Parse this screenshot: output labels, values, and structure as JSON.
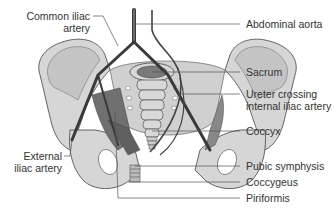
{
  "diagram": {
    "type": "anatomical illustration",
    "colors": {
      "bone_fill": "#d6d6d6",
      "bone_inner": "#c4c4c4",
      "outline": "#555555",
      "vessel": "#3a3a3a",
      "muscle": "#707070",
      "leader": "#555555",
      "text": "#333333"
    },
    "labels_left": [
      {
        "id": "common-iliac-artery",
        "line1": "Common iliac",
        "line2": "artery"
      },
      {
        "id": "external-iliac-artery",
        "line1": "External",
        "line2": "iliac artery"
      }
    ],
    "labels_right": [
      {
        "id": "abdominal-aorta",
        "line1": "Abdominal aorta"
      },
      {
        "id": "sacrum",
        "line1": "Sacrum"
      },
      {
        "id": "ureter-crossing",
        "line1": "Ureter crossing",
        "line2": "internal iliac artery"
      },
      {
        "id": "coccyx",
        "line1": "Coccyx"
      },
      {
        "id": "pubic-symphysis",
        "line1": "Pubic symphysis"
      },
      {
        "id": "coccygeus",
        "line1": "Coccygeus"
      },
      {
        "id": "piriformis",
        "line1": "Piriformis"
      }
    ]
  }
}
